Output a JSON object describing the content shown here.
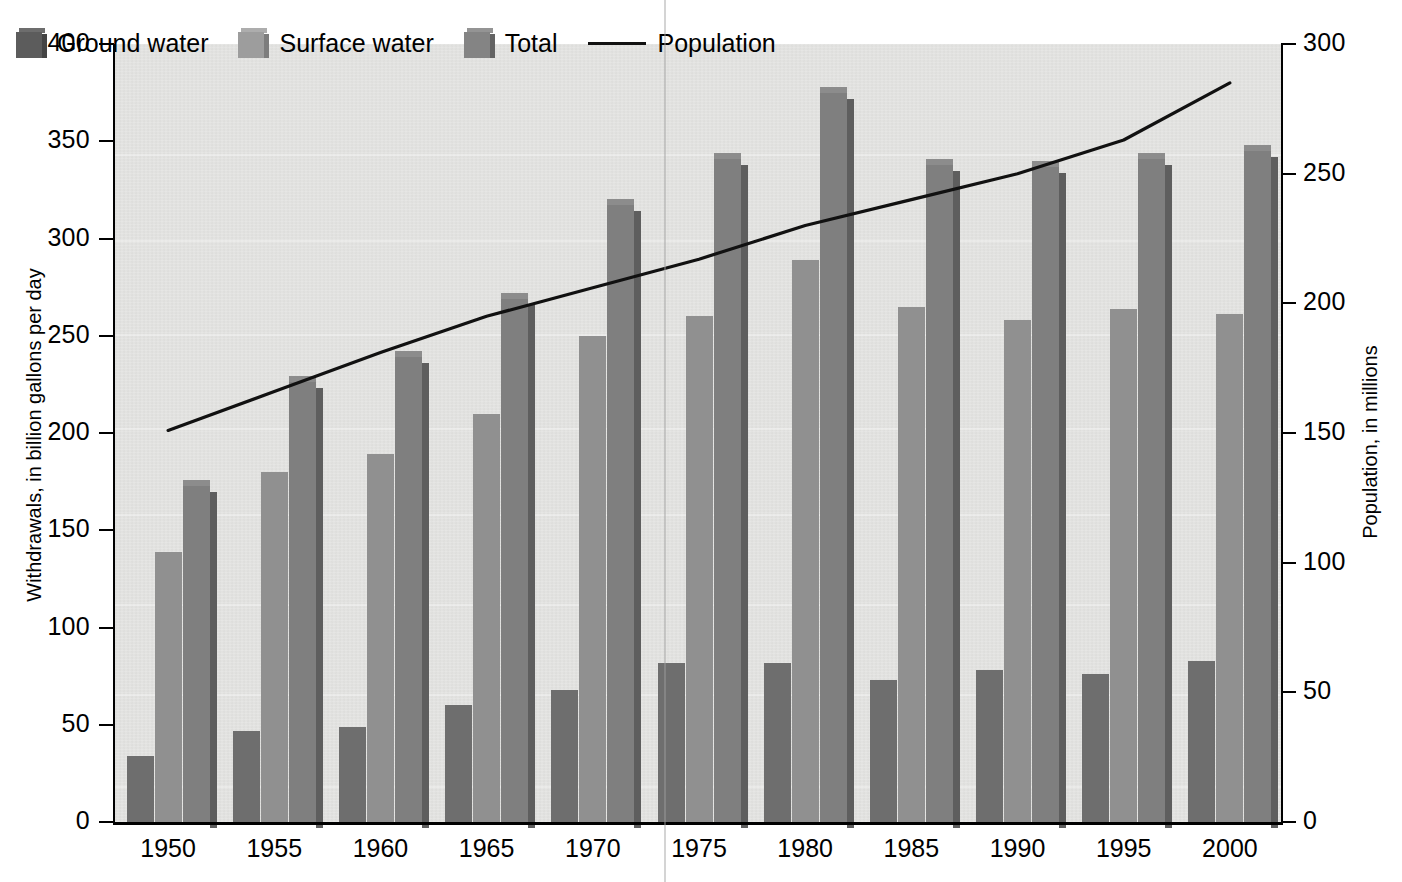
{
  "chart_data": {
    "type": "bar",
    "title": "",
    "subtitle": "",
    "xlabel": "",
    "ylabel": "Withdrawals, in billion gallons per day",
    "y2label": "Population, in millions",
    "categories": [
      "1950",
      "1955",
      "1960",
      "1965",
      "1970",
      "1975",
      "1980",
      "1985",
      "1990",
      "1995",
      "2000"
    ],
    "ylim": [
      0,
      400
    ],
    "y2lim": [
      0,
      300
    ],
    "yticks": [
      0,
      50,
      100,
      150,
      200,
      250,
      300,
      350,
      400
    ],
    "y2ticks": [
      0,
      50,
      100,
      150,
      200,
      250,
      300
    ],
    "grid": false,
    "legend_position": "top-left",
    "series": [
      {
        "name": "Ground water",
        "type": "bar",
        "axis": "left",
        "color": "#6e6e6e",
        "values": [
          34,
          47,
          49,
          60,
          68,
          82,
          82,
          73,
          78,
          76,
          83
        ]
      },
      {
        "name": "Surface water",
        "type": "bar",
        "axis": "left",
        "color": "#909090",
        "values": [
          139,
          180,
          189,
          210,
          250,
          260,
          289,
          265,
          258,
          264,
          261
        ]
      },
      {
        "name": "Total",
        "type": "bar",
        "axis": "left",
        "color": "#7f7f7f",
        "values": [
          173,
          226,
          239,
          269,
          317,
          341,
          375,
          338,
          337,
          341,
          345
        ]
      },
      {
        "name": "Population",
        "type": "line",
        "axis": "right",
        "color": "#111111",
        "values": [
          151,
          166,
          181,
          195,
          206,
          217,
          230,
          240,
          250,
          263,
          285
        ]
      }
    ]
  },
  "legend": {
    "items": [
      {
        "label": "Ground water",
        "marker": "swatch-dark"
      },
      {
        "label": "Surface water",
        "marker": "swatch-light"
      },
      {
        "label": "Total",
        "marker": "swatch-mid"
      },
      {
        "label": "Population",
        "marker": "line"
      }
    ]
  },
  "axes": {
    "left": {
      "title": "Withdrawals, in billion gallons per day",
      "labels": [
        "400",
        "350",
        "300",
        "250",
        "200",
        "150",
        "100",
        "50",
        "0"
      ]
    },
    "right": {
      "title": "Population, in millions",
      "labels": [
        "300",
        "250",
        "200",
        "150",
        "100",
        "50",
        "0"
      ]
    },
    "bottom": {
      "labels": [
        "1950",
        "1955",
        "1960",
        "1965",
        "1970",
        "1975",
        "1980",
        "1985",
        "1990",
        "1995",
        "2000"
      ]
    }
  },
  "colors": {
    "plot_background": "#e4e4e2",
    "ground_water": "#6e6e6e",
    "surface_water": "#909090",
    "total": "#7f7f7f",
    "population_line": "#111111",
    "axis": "#000000"
  }
}
